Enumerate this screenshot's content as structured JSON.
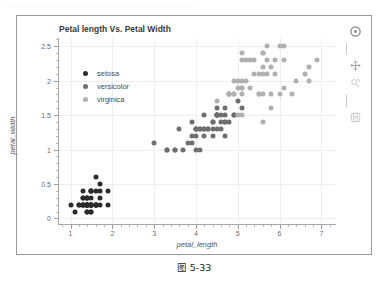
{
  "page": {
    "top_strip_text": "……………………………………………………………………",
    "caption": "图 5-33"
  },
  "toolbar": {
    "tools": [
      {
        "name": "bokeh-logo-icon",
        "label": "Bokeh"
      },
      {
        "name": "pan-icon",
        "label": "Pan"
      },
      {
        "name": "box-zoom-icon",
        "label": "Box Zoom"
      },
      {
        "name": "save-icon",
        "label": "Save"
      }
    ]
  },
  "chart_data": {
    "type": "scatter",
    "title": "Petal length Vs. Petal Width",
    "xlabel": "petal_length",
    "ylabel": "petal_width",
    "xlim": [
      0.7,
      7.35
    ],
    "ylim": [
      -0.08,
      2.62
    ],
    "xticks": [
      1,
      2,
      3,
      4,
      5,
      6,
      7
    ],
    "xtick_labels": [
      "1",
      "2",
      "3",
      "4",
      "5",
      "6",
      "7"
    ],
    "yticks": [
      0,
      0.5,
      1,
      1.5,
      2,
      2.5
    ],
    "ytick_labels": [
      "0",
      "0.5",
      "1",
      "1.5",
      "2",
      "2.5"
    ],
    "grid": true,
    "legend_position": "top-left",
    "marker_size_px": 5,
    "series": [
      {
        "name": "setosa",
        "color": "#2b2b2b",
        "x": [
          1.4,
          1.4,
          1.3,
          1.5,
          1.4,
          1.7,
          1.4,
          1.5,
          1.4,
          1.5,
          1.5,
          1.6,
          1.4,
          1.1,
          1.2,
          1.5,
          1.3,
          1.4,
          1.7,
          1.5,
          1.7,
          1.5,
          1.0,
          1.7,
          1.9,
          1.6,
          1.6,
          1.5,
          1.4,
          1.6,
          1.6,
          1.5,
          1.5,
          1.4,
          1.5,
          1.2,
          1.3,
          1.4,
          1.3,
          1.5,
          1.3,
          1.3,
          1.3,
          1.6,
          1.9,
          1.4,
          1.6,
          1.4,
          1.5,
          1.4
        ],
        "y": [
          0.2,
          0.2,
          0.2,
          0.2,
          0.2,
          0.4,
          0.3,
          0.2,
          0.2,
          0.1,
          0.2,
          0.2,
          0.1,
          0.1,
          0.2,
          0.4,
          0.4,
          0.3,
          0.3,
          0.3,
          0.2,
          0.4,
          0.2,
          0.5,
          0.2,
          0.2,
          0.4,
          0.2,
          0.2,
          0.2,
          0.2,
          0.4,
          0.1,
          0.2,
          0.2,
          0.2,
          0.2,
          0.1,
          0.2,
          0.2,
          0.3,
          0.3,
          0.2,
          0.6,
          0.4,
          0.3,
          0.2,
          0.2,
          0.2,
          0.2
        ]
      },
      {
        "name": "versicolor",
        "color": "#6e6e6e",
        "x": [
          4.7,
          4.5,
          4.9,
          4.0,
          4.6,
          4.5,
          4.7,
          3.3,
          4.6,
          3.9,
          3.5,
          4.2,
          4.0,
          4.7,
          3.6,
          4.4,
          4.5,
          4.1,
          4.5,
          3.9,
          4.8,
          4.0,
          4.9,
          4.7,
          4.3,
          4.4,
          4.8,
          5.0,
          4.5,
          3.5,
          3.8,
          3.7,
          3.9,
          5.1,
          4.5,
          4.5,
          4.7,
          4.4,
          4.1,
          4.0,
          4.4,
          4.6,
          4.0,
          3.3,
          4.2,
          4.2,
          4.2,
          4.3,
          3.0,
          4.1
        ],
        "y": [
          1.4,
          1.5,
          1.5,
          1.3,
          1.5,
          1.3,
          1.6,
          1.0,
          1.3,
          1.4,
          1.0,
          1.5,
          1.0,
          1.4,
          1.3,
          1.4,
          1.5,
          1.0,
          1.5,
          1.1,
          1.8,
          1.3,
          1.5,
          1.2,
          1.3,
          1.4,
          1.4,
          1.7,
          1.5,
          1.0,
          1.1,
          1.0,
          1.2,
          1.6,
          1.5,
          1.6,
          1.5,
          1.3,
          1.3,
          1.3,
          1.2,
          1.4,
          1.2,
          1.0,
          1.3,
          1.2,
          1.3,
          1.3,
          1.1,
          1.3
        ]
      },
      {
        "name": "virginica",
        "color": "#b0b0b0",
        "x": [
          6.0,
          5.1,
          5.9,
          5.6,
          5.8,
          6.6,
          4.5,
          6.3,
          5.8,
          6.1,
          5.1,
          5.3,
          5.5,
          5.0,
          5.1,
          5.3,
          5.5,
          6.7,
          6.9,
          5.0,
          5.7,
          4.9,
          6.7,
          4.9,
          5.7,
          6.0,
          4.8,
          4.9,
          5.6,
          5.8,
          6.1,
          6.4,
          5.6,
          5.1,
          5.6,
          6.1,
          5.6,
          5.5,
          4.8,
          5.4,
          5.6,
          5.1,
          5.1,
          5.9,
          5.7,
          5.2,
          5.0,
          5.2,
          5.4,
          5.1
        ],
        "y": [
          2.5,
          1.9,
          2.1,
          1.8,
          2.2,
          2.1,
          1.7,
          1.8,
          1.8,
          2.5,
          2.0,
          1.9,
          2.1,
          2.0,
          2.4,
          2.3,
          1.8,
          2.2,
          2.3,
          1.5,
          2.3,
          2.0,
          2.0,
          1.8,
          2.1,
          1.8,
          1.8,
          1.8,
          2.1,
          1.6,
          1.9,
          2.0,
          2.2,
          1.5,
          1.4,
          2.3,
          2.4,
          1.8,
          1.8,
          2.1,
          2.4,
          2.3,
          1.9,
          2.3,
          2.5,
          2.3,
          1.9,
          2.0,
          2.3,
          1.8
        ]
      }
    ]
  }
}
